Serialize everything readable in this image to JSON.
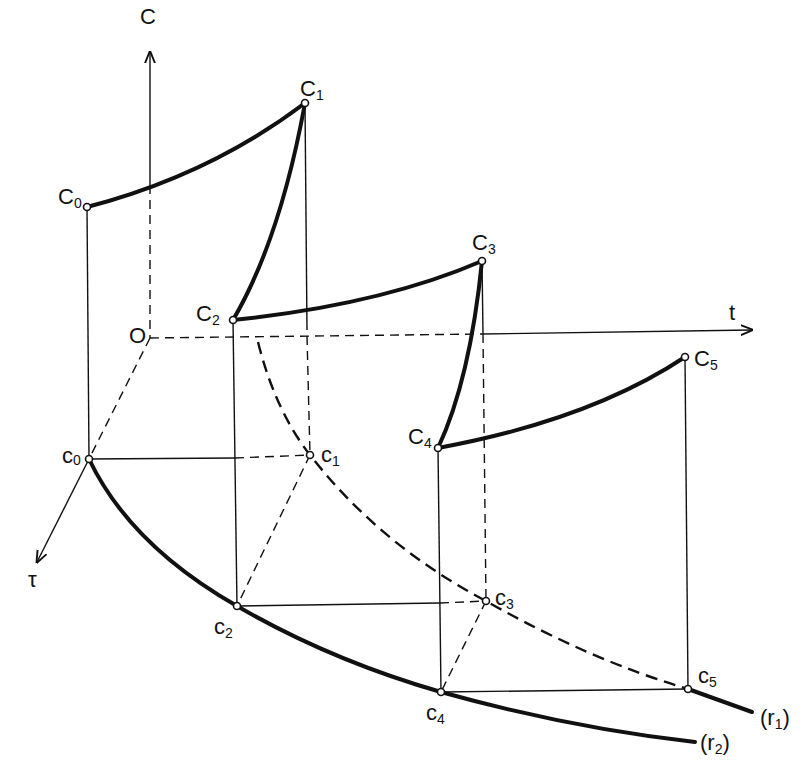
{
  "diagram": {
    "axes": {
      "C": {
        "label": "C",
        "origin": [
          150,
          338
        ],
        "end": [
          150,
          50
        ]
      },
      "t": {
        "label": "t",
        "end": [
          755,
          330
        ]
      },
      "tau": {
        "label": "τ",
        "end": [
          35,
          565
        ]
      },
      "origin_label": "O"
    },
    "upper_points": [
      {
        "name": "C",
        "sub": "0",
        "x": 87,
        "y": 207
      },
      {
        "name": "C",
        "sub": "1",
        "x": 305,
        "y": 103
      },
      {
        "name": "C",
        "sub": "2",
        "x": 233,
        "y": 320
      },
      {
        "name": "C",
        "sub": "3",
        "x": 482,
        "y": 261
      },
      {
        "name": "C",
        "sub": "4",
        "x": 438,
        "y": 448
      },
      {
        "name": "C",
        "sub": "5",
        "x": 685,
        "y": 357
      }
    ],
    "lower_points": [
      {
        "name": "c",
        "sub": "0",
        "x": 89,
        "y": 459
      },
      {
        "name": "c",
        "sub": "1",
        "x": 310,
        "y": 455
      },
      {
        "name": "c",
        "sub": "2",
        "x": 237,
        "y": 606
      },
      {
        "name": "c",
        "sub": "3",
        "x": 486,
        "y": 601
      },
      {
        "name": "c",
        "sub": "4",
        "x": 441,
        "y": 692
      },
      {
        "name": "c",
        "sub": "5",
        "x": 688,
        "y": 689
      }
    ],
    "curves": {
      "r1": {
        "label": "(r",
        "sub": "1",
        "close": ")",
        "style": "dashed then solid"
      },
      "r2": {
        "label": "(r",
        "sub": "2",
        "close": ")",
        "style": "solid"
      }
    }
  }
}
